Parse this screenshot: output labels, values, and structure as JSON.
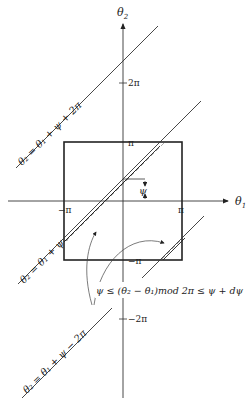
{
  "diagram": {
    "axes": {
      "x_label": "θ",
      "x_label_sub": "1",
      "y_label": "θ",
      "y_label_sub": "2"
    },
    "ticks": {
      "pi_top": "π",
      "pi_right": "π",
      "neg_pi_left": "−π",
      "neg_pi_bottom": "−π",
      "two_pi": "2π",
      "neg_two_pi": "−2π"
    },
    "psi_marker": "ψ",
    "lines": [
      {
        "id": "upper",
        "label": "θ₂ = θ₁ + ψ + 2π"
      },
      {
        "id": "central",
        "label": "θ₂ = θ₁ + ψ"
      },
      {
        "id": "lower",
        "label": "θ₂ = θ₁ + ψ − 2π"
      }
    ],
    "annotation": "ψ ≤ (θ₂ − θ₁)mod 2π ≤ ψ + dψ",
    "colors": {
      "ink": "#222222",
      "background": "#ffffff"
    }
  }
}
